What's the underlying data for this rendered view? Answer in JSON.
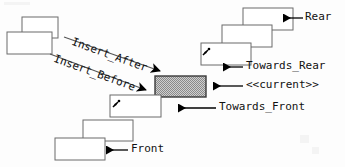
{
  "diagram": {
    "colors": {
      "stroke": "#4a4a4a",
      "text": "#111111",
      "arrow": "#000000",
      "current_fill": "#9a9a9a",
      "background": "#fdfdfd",
      "box_fill": "#ffffff"
    },
    "labels": {
      "rear": "Rear",
      "towards_rear": "Towards_Rear",
      "current": "<<current>>",
      "towards_front": "Towards_Front",
      "front": "Front",
      "insert_after": "Insert_After",
      "insert_before": "Insert_Before"
    },
    "nodes": [
      {
        "name": "detached-upper",
        "x": 22,
        "y": 17,
        "w": 36,
        "h": 21,
        "fill": "plain"
      },
      {
        "name": "detached-lower",
        "x": 7,
        "y": 32,
        "w": 45,
        "h": 22,
        "fill": "plain"
      },
      {
        "name": "rear-node",
        "x": 243,
        "y": 8,
        "w": 50,
        "h": 22,
        "fill": "plain"
      },
      {
        "name": "towards-rear-upper",
        "x": 222,
        "y": 25,
        "w": 50,
        "h": 22,
        "fill": "plain"
      },
      {
        "name": "towards-rear-node",
        "x": 201,
        "y": 43,
        "w": 50,
        "h": 22,
        "fill": "plain"
      },
      {
        "name": "current-node",
        "x": 155,
        "y": 76,
        "w": 51,
        "h": 21,
        "fill": "checkered"
      },
      {
        "name": "towards-front-node",
        "x": 110,
        "y": 95,
        "w": 51,
        "h": 22,
        "fill": "plain"
      },
      {
        "name": "front-upper",
        "x": 83,
        "y": 120,
        "w": 50,
        "h": 21,
        "fill": "plain"
      },
      {
        "name": "front-node",
        "x": 55,
        "y": 138,
        "w": 50,
        "h": 22,
        "fill": "plain"
      }
    ],
    "callouts": [
      {
        "name": "rear",
        "label": "Rear",
        "text_x": 305,
        "text_y": 14,
        "arrow_from_x": 303,
        "arrow_to_x": 281,
        "arrow_y": 18
      },
      {
        "name": "towards-rear",
        "label": "Towards_Rear",
        "text_x": 246,
        "text_y": 63,
        "arrow_from_x": 243,
        "arrow_to_x": 221,
        "arrow_y": 67
      },
      {
        "name": "current",
        "label": "<<current>>",
        "text_x": 246,
        "text_y": 82,
        "arrow_from_x": 243,
        "arrow_to_x": 211,
        "arrow_y": 86
      },
      {
        "name": "towards-front",
        "label": "Towards_Front",
        "text_x": 219,
        "text_y": 104,
        "arrow_from_x": 216,
        "arrow_to_x": 176,
        "arrow_y": 108
      },
      {
        "name": "front",
        "label": "Front",
        "text_x": 131,
        "text_y": 146,
        "arrow_from_x": 128,
        "arrow_to_x": 104,
        "arrow_y": 150
      }
    ],
    "insert_arrows": [
      {
        "name": "insert-after",
        "label": "Insert_After",
        "x1": 64,
        "y1": 37,
        "x2": 166,
        "y2": 73,
        "label_x": 74,
        "label_y": 45,
        "angle": 20
      },
      {
        "name": "insert-before",
        "label": "Insert_Before",
        "x1": 50,
        "y1": 54,
        "x2": 152,
        "y2": 92,
        "label_x": 58,
        "label_y": 62,
        "angle": 20
      }
    ]
  }
}
